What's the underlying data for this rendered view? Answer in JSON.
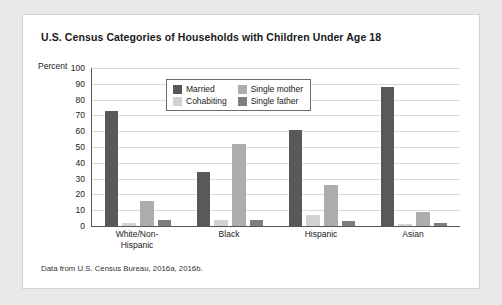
{
  "figure": {
    "title": "U.S. Census Categories of Households with Children Under Age 18",
    "source_note": "Data from U.S. Census Bureau, 2016a, 2016b.",
    "axis_label": "Percent"
  },
  "colors": {
    "married": "#595959",
    "cohabiting": "#d2d2d2",
    "single_mother": "#adadad",
    "single_father": "#7d7d7d",
    "panel_background": "#ffffff",
    "page_background": "#e9e9e9",
    "gridline": "#d9d9d9",
    "axis": "#555555"
  },
  "chart_data": {
    "type": "bar",
    "title": "U.S. Census Categories of Households with Children Under Age 18",
    "xlabel": "",
    "ylabel": "Percent",
    "ylim": [
      0,
      100
    ],
    "yticks": [
      0,
      10,
      20,
      30,
      40,
      50,
      60,
      70,
      80,
      90,
      100
    ],
    "grid": true,
    "legend_position": "upper center",
    "categories": [
      "White/Non-Hispanic",
      "Black",
      "Hispanic",
      "Asian"
    ],
    "category_lines": [
      [
        "White/Non-",
        "Hispanic"
      ],
      [
        "Black"
      ],
      [
        "Hispanic"
      ],
      [
        "Asian"
      ]
    ],
    "series": [
      {
        "name": "Married",
        "values": [
          73,
          34,
          61,
          88
        ]
      },
      {
        "name": "Cohabiting",
        "values": [
          2,
          4,
          7,
          1
        ]
      },
      {
        "name": "Single mother",
        "values": [
          16,
          52,
          26,
          9
        ]
      },
      {
        "name": "Single father",
        "values": [
          4,
          4,
          3,
          2
        ]
      }
    ]
  },
  "legend": {
    "entries": [
      {
        "label": "Married",
        "color_key": "married"
      },
      {
        "label": "Single mother",
        "color_key": "single_mother"
      },
      {
        "label": "Cohabiting",
        "color_key": "cohabiting"
      },
      {
        "label": "Single father",
        "color_key": "single_father"
      }
    ]
  }
}
